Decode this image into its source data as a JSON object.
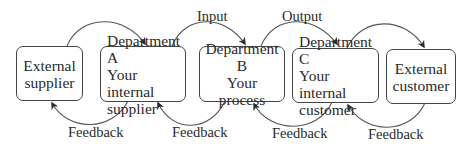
{
  "diagram": {
    "nodes": [
      {
        "id": "external-supplier",
        "lines": [
          "External",
          "supplier"
        ]
      },
      {
        "id": "department-a",
        "lines": [
          "Department A",
          "Your internal",
          "supplier"
        ]
      },
      {
        "id": "department-b",
        "lines": [
          "Department B",
          "Your process"
        ]
      },
      {
        "id": "department-c",
        "lines": [
          "Department C",
          "Your internal",
          "customer"
        ]
      },
      {
        "id": "external-customer",
        "lines": [
          "External",
          "customer"
        ]
      }
    ],
    "labels": {
      "input": "Input",
      "output": "Output",
      "feedback": [
        "Feedback",
        "Feedback",
        "Feedback",
        "Feedback"
      ]
    },
    "colors": {
      "stroke": "#444444",
      "text": "#2a2a2a",
      "background": "#ffffff"
    }
  }
}
